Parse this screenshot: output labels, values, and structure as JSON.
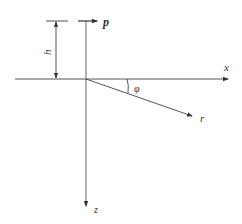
{
  "diagram": {
    "type": "coordinate-geometry",
    "labels": {
      "x_axis": "x",
      "z_axis": "z",
      "force": "p",
      "height": "h",
      "radius": "r",
      "angle": "φ"
    },
    "colors": {
      "line": "#555555",
      "text": "#333333",
      "background": "#ffffff"
    }
  }
}
